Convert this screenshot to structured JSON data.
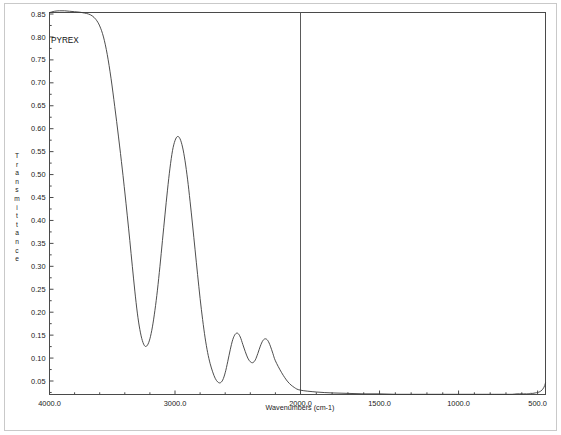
{
  "chart_data": {
    "type": "line",
    "title": "",
    "annotation": "PYREX",
    "xlabel": "Wavenumbers (cm-1)",
    "ylabel": "Transmittance",
    "ylabel_letters": [
      "T",
      "r",
      "a",
      "n",
      "s",
      "m",
      "i",
      "t",
      "t",
      "a",
      "n",
      "c",
      "e"
    ],
    "grid": false,
    "legend": null,
    "xlim": [
      4000.0,
      450.0
    ],
    "ylim": [
      0.02,
      0.87
    ],
    "x_reversed": true,
    "x_axis_note": "piecewise scale: 4000-2000 occupies left half, 2000-450 occupies right half",
    "xticks": [
      4000.0,
      3000.0,
      2000.0,
      1500.0,
      1000.0,
      500.0
    ],
    "xtick_labels": [
      "4000.0",
      "3000.0",
      "2000.0",
      "1500.0",
      "1000.0",
      "500.0"
    ],
    "yticks": [
      0.05,
      0.1,
      0.15,
      0.2,
      0.25,
      0.3,
      0.35,
      0.4,
      0.45,
      0.5,
      0.55,
      0.6,
      0.65,
      0.7,
      0.75,
      0.8,
      0.85
    ],
    "ytick_labels": [
      "0.05",
      "0.10",
      "0.15",
      "0.20",
      "0.25",
      "0.30",
      "0.35",
      "0.40",
      "0.45",
      "0.50",
      "0.55",
      "0.60",
      "0.65",
      "0.70",
      "0.75",
      "0.80",
      "0.85"
    ],
    "divider_at_x": 2000.0,
    "series": [
      {
        "name": "PYREX transmittance",
        "color": "#3a3a3a",
        "x": [
          4000,
          3960,
          3920,
          3880,
          3840,
          3800,
          3760,
          3720,
          3690,
          3660,
          3630,
          3600,
          3570,
          3540,
          3510,
          3480,
          3450,
          3420,
          3400,
          3380,
          3360,
          3340,
          3320,
          3300,
          3280,
          3260,
          3240,
          3220,
          3200,
          3180,
          3160,
          3140,
          3120,
          3100,
          3080,
          3060,
          3040,
          3020,
          3000,
          2980,
          2960,
          2940,
          2920,
          2900,
          2880,
          2860,
          2840,
          2820,
          2800,
          2780,
          2760,
          2740,
          2720,
          2700,
          2680,
          2660,
          2640,
          2620,
          2600,
          2580,
          2560,
          2540,
          2520,
          2500,
          2480,
          2460,
          2440,
          2420,
          2400,
          2380,
          2360,
          2340,
          2320,
          2300,
          2280,
          2260,
          2240,
          2220,
          2200,
          2150,
          2100,
          2050,
          2000,
          1900,
          1800,
          1700,
          1600,
          1500,
          1400,
          1300,
          1200,
          1100,
          1000,
          900,
          800,
          750,
          700,
          660,
          630,
          600,
          580,
          560,
          545,
          530,
          515,
          500,
          490,
          480,
          470,
          462,
          455,
          450
        ],
        "y": [
          0.853,
          0.856,
          0.857,
          0.857,
          0.856,
          0.855,
          0.854,
          0.852,
          0.85,
          0.846,
          0.838,
          0.824,
          0.8,
          0.762,
          0.71,
          0.648,
          0.582,
          0.512,
          0.462,
          0.41,
          0.356,
          0.3,
          0.246,
          0.198,
          0.162,
          0.138,
          0.126,
          0.128,
          0.142,
          0.168,
          0.204,
          0.248,
          0.3,
          0.356,
          0.412,
          0.466,
          0.514,
          0.552,
          0.574,
          0.583,
          0.578,
          0.56,
          0.53,
          0.49,
          0.442,
          0.39,
          0.336,
          0.282,
          0.23,
          0.184,
          0.144,
          0.112,
          0.088,
          0.07,
          0.056,
          0.048,
          0.046,
          0.052,
          0.068,
          0.092,
          0.118,
          0.14,
          0.152,
          0.154,
          0.146,
          0.13,
          0.114,
          0.1,
          0.092,
          0.09,
          0.096,
          0.11,
          0.126,
          0.138,
          0.142,
          0.138,
          0.126,
          0.11,
          0.094,
          0.068,
          0.048,
          0.036,
          0.03,
          0.026,
          0.024,
          0.023,
          0.022,
          0.022,
          0.021,
          0.021,
          0.021,
          0.021,
          0.021,
          0.021,
          0.021,
          0.021,
          0.021,
          0.021,
          0.022,
          0.022,
          0.022,
          0.022,
          0.023,
          0.023,
          0.024,
          0.025,
          0.026,
          0.028,
          0.031,
          0.035,
          0.04,
          0.046
        ]
      }
    ]
  }
}
